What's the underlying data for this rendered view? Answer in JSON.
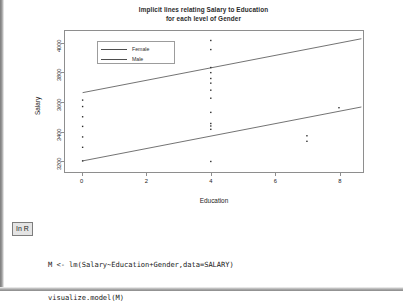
{
  "figure": {
    "title_line1": "Implicit lines relating Salary to Education",
    "title_line2": "for each level of Gender"
  },
  "legend": {
    "items": [
      {
        "label": "Female",
        "color": "#4e4e4e"
      },
      {
        "label": "Male",
        "color": "#4e4e4e"
      }
    ]
  },
  "axes": {
    "ylabel": "Salary",
    "xlabel": "Education",
    "yticks": [
      "3200",
      "3400",
      "3600",
      "3800",
      "4000"
    ],
    "xticks": [
      "0",
      "2",
      "4",
      "6",
      "8"
    ]
  },
  "code_block": {
    "badge": "In R",
    "line1": "M <- lm(Salary~Education+Gender,data=SALARY)",
    "line2": "visualize.model(M)"
  },
  "chart_data": {
    "type": "scatter",
    "title": "Implicit lines relating Salary to Education for each level of Gender",
    "xlabel": "Education",
    "ylabel": "Salary",
    "xlim": [
      -0.55,
      8.75
    ],
    "ylim": [
      3120,
      4085
    ],
    "xticks": [
      0,
      2,
      4,
      6,
      8
    ],
    "yticks": [
      3200,
      3400,
      3600,
      3800,
      4000
    ],
    "grid": false,
    "legend_position": "top-left-inside",
    "series": [
      {
        "name": "Female",
        "kind": "line",
        "color": "#4e4e4e",
        "line": {
          "x": [
            0,
            8.7
          ],
          "y": [
            3663,
            4032
          ],
          "intercept": 3663,
          "slope": 42.4
        }
      },
      {
        "name": "Male",
        "kind": "line",
        "color": "#4e4e4e",
        "line": {
          "x": [
            0,
            8.7
          ],
          "y": [
            3196,
            3565
          ],
          "intercept": 3196,
          "slope": 42.4
        }
      }
    ],
    "points": [
      {
        "x": 0,
        "y": 3196
      },
      {
        "x": 0,
        "y": 3289
      },
      {
        "x": 0,
        "y": 3360
      },
      {
        "x": 0,
        "y": 3432
      },
      {
        "x": 0,
        "y": 3498
      },
      {
        "x": 0,
        "y": 3568
      },
      {
        "x": 0,
        "y": 3612
      },
      {
        "x": 4,
        "y": 3192
      },
      {
        "x": 4,
        "y": 3412
      },
      {
        "x": 4,
        "y": 3435
      },
      {
        "x": 4,
        "y": 3452
      },
      {
        "x": 4,
        "y": 3528
      },
      {
        "x": 4,
        "y": 3625
      },
      {
        "x": 4,
        "y": 3680
      },
      {
        "x": 4,
        "y": 3728
      },
      {
        "x": 4,
        "y": 3760
      },
      {
        "x": 4,
        "y": 3800
      },
      {
        "x": 4,
        "y": 3835
      },
      {
        "x": 4,
        "y": 3958
      },
      {
        "x": 4,
        "y": 4020
      },
      {
        "x": 7,
        "y": 3368
      },
      {
        "x": 7,
        "y": 3330
      },
      {
        "x": 8,
        "y": 3560
      }
    ]
  }
}
